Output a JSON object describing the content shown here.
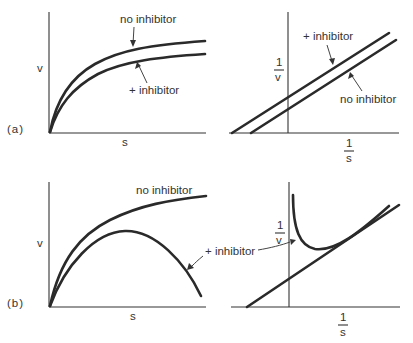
{
  "figure": {
    "panel_a": {
      "label": "(a)",
      "direct_plot": {
        "ylabel": "v",
        "xlabel": "s",
        "curve_upper_label": "no inhibitor",
        "curve_lower_label": "+ inhibitor"
      },
      "reciprocal_plot": {
        "ylabel_num": "1",
        "ylabel_den": "v",
        "xlabel_num": "1",
        "xlabel_den": "s",
        "line_upper_label": "+ inhibitor",
        "line_lower_label": "no inhibitor"
      }
    },
    "panel_b": {
      "label": "(b)",
      "direct_plot": {
        "ylabel": "v",
        "xlabel": "s",
        "curve_upper_label": "no inhibitor",
        "curve_lower_label": "+ inhibitor"
      },
      "reciprocal_plot": {
        "ylabel_num": "1",
        "ylabel_den": "v",
        "xlabel_num": "1",
        "xlabel_den": "s"
      }
    },
    "colors": {
      "line": "#2a2a2a",
      "text": "#333333",
      "background": "#ffffff"
    }
  }
}
